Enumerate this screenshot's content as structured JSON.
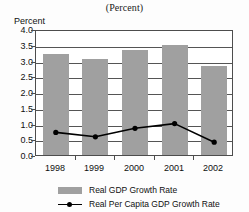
{
  "subtitle": "(Percent)",
  "axis": {
    "ylabel": "Percent",
    "yticks": [
      "4.0",
      "3.5",
      "3.0",
      "2.5",
      "2.0",
      "1.5",
      "1.0",
      "0.5",
      "0.0"
    ],
    "xticks": [
      "1998",
      "1999",
      "2000",
      "2001",
      "2002"
    ]
  },
  "legend": {
    "items": [
      {
        "label": "Real GDP Growth Rate",
        "marker": "bar-swatch",
        "color": "#a0a0a0"
      },
      {
        "label": "Real Per Capita GDP Growth Rate",
        "marker": "line-marker",
        "color": "#000000"
      }
    ]
  },
  "chart_data": {
    "type": "bar",
    "title": "",
    "subtitle": "(Percent)",
    "xlabel": "",
    "ylabel": "Percent",
    "ylim": [
      0.0,
      4.0
    ],
    "ytick_step": 0.5,
    "grid": true,
    "legend_position": "bottom",
    "categories": [
      "1998",
      "1999",
      "2000",
      "2001",
      "2002"
    ],
    "series": [
      {
        "name": "Real GDP Growth Rate",
        "type": "bar",
        "color": "#a0a0a0",
        "values": [
          3.21,
          3.06,
          3.33,
          3.49,
          2.84
        ]
      },
      {
        "name": "Real Per Capita GDP Growth Rate",
        "type": "line",
        "color": "#000000",
        "values": [
          0.78,
          0.64,
          0.91,
          1.06,
          0.47
        ]
      }
    ]
  }
}
